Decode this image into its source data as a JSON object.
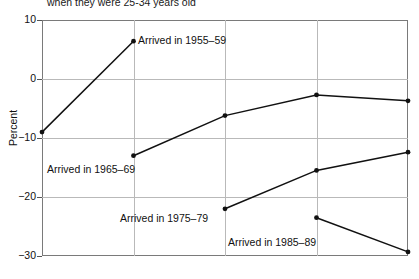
{
  "chart_data": {
    "type": "line",
    "title": "when they were 25-34 years old",
    "xlabel": "",
    "ylabel": "Percent",
    "ylim": [
      -30,
      10
    ],
    "yticks": [
      10,
      0,
      -10,
      -20,
      -30
    ],
    "ytick_labels": [
      "10",
      "0",
      "−10",
      "−20",
      "−30"
    ],
    "xlim": [
      0,
      4
    ],
    "x": [
      0,
      1,
      2,
      3,
      4
    ],
    "xticks": [
      0,
      1,
      2,
      3,
      4
    ],
    "xtick_labels": [
      "",
      "",
      "",
      "",
      ""
    ],
    "grid": true,
    "legend": "inline-annotations",
    "series": [
      {
        "name": "Arrived in 1955–59",
        "x": [
          0,
          1
        ],
        "values": [
          -9.0,
          6.4
        ],
        "label_x": 138,
        "label_y": 34
      },
      {
        "name": "Arrived in 1965–69",
        "x": [
          1,
          2,
          3,
          4
        ],
        "values": [
          -13.0,
          -6.2,
          -2.7,
          -3.7
        ],
        "label_x": 47,
        "label_y": 163
      },
      {
        "name": "Arrived in 1975–79",
        "x": [
          2,
          3,
          4
        ],
        "values": [
          -22.0,
          -15.5,
          -12.4
        ],
        "label_x": 120,
        "label_y": 212
      },
      {
        "name": "Arrived in 1985–89",
        "x": [
          3,
          4
        ],
        "values": [
          -23.5,
          -29.3
        ],
        "label_x": 228,
        "label_y": 236
      }
    ]
  }
}
